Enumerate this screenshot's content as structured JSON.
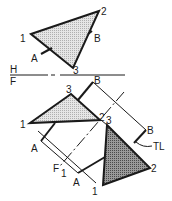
{
  "diagram": {
    "type": "descriptive-geometry-auxiliary-view",
    "colors": {
      "line": "#1a1a1a",
      "light_fill": "#d8d8d8",
      "dark_fill": "#8a8a8a",
      "background": "#ffffff"
    },
    "fold_line": {
      "upper_label": "H",
      "lower_label": "F"
    },
    "top_view": {
      "vertices": [
        {
          "label": "1",
          "x": 31,
          "y": 34
        },
        {
          "label": "2",
          "x": 99,
          "y": 11
        },
        {
          "label": "3",
          "x": 73,
          "y": 68
        }
      ],
      "line_labels": {
        "a": "A",
        "b": "B"
      }
    },
    "front_view": {
      "vertices": [
        {
          "label": "1",
          "x": 30,
          "y": 123
        },
        {
          "label": "2",
          "x": 100,
          "y": 120
        },
        {
          "label": "3",
          "x": 71,
          "y": 94
        }
      ],
      "line_labels": {
        "a": "A",
        "b": "B"
      }
    },
    "auxiliary_view": {
      "vertices": [
        {
          "label": "1",
          "x": 103,
          "y": 185
        },
        {
          "label": "2",
          "x": 150,
          "y": 168
        },
        {
          "label": "3",
          "x": 107,
          "y": 125
        }
      ],
      "line_labels": {
        "a": "A",
        "b": "B"
      },
      "true_length_label": "TL"
    },
    "fold_line_2": {
      "label_f": "F",
      "label_1": "1"
    },
    "labels": {
      "top_1": "1",
      "top_2": "2",
      "top_3": "3",
      "top_A": "A",
      "top_B": "B",
      "H": "H",
      "F": "F",
      "front_1": "1",
      "front_3": "3",
      "front_2": "2",
      "front_A": "A",
      "front_B": "B",
      "aux_3": "3",
      "aux_2": "2",
      "aux_1": "1",
      "aux_A": "A",
      "aux_B": "B",
      "TL": "TL",
      "F1_F": "F",
      "F1_1": "1"
    }
  }
}
